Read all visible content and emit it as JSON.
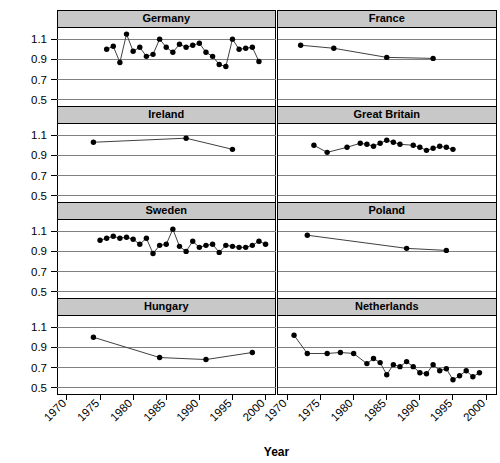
{
  "chart_data": {
    "type": "line",
    "title": "",
    "xlabel": "Year",
    "ylabel": "",
    "xlim": [
      1968.5,
      2001.5
    ],
    "ylim": [
      0.44,
      1.22
    ],
    "xticks": [
      1970,
      1975,
      1980,
      1985,
      1990,
      1995,
      2000
    ],
    "yticks": [
      0.5,
      0.7,
      0.9,
      1.1
    ],
    "grid": true,
    "legend": "none",
    "layout": "2 columns x 4 rows of panels (lattice/trellis), shared axes",
    "marker": "filled circle",
    "panels": [
      {
        "name": "Germany",
        "row": 1,
        "col": 1,
        "x": [
          1976,
          1977,
          1978,
          1979,
          1980,
          1981,
          1982,
          1983,
          1984,
          1985,
          1986,
          1987,
          1988,
          1989,
          1990,
          1991,
          1992,
          1993,
          1994,
          1995,
          1996,
          1997,
          1998,
          1999
        ],
        "y": [
          1.0,
          1.03,
          0.87,
          1.15,
          0.98,
          1.02,
          0.93,
          0.95,
          1.1,
          1.02,
          0.97,
          1.05,
          1.02,
          1.04,
          1.06,
          0.97,
          0.93,
          0.85,
          0.83,
          1.1,
          1.0,
          1.01,
          1.02,
          0.88
        ],
        "n_points": 24
      },
      {
        "name": "France",
        "row": 1,
        "col": 2,
        "x": [
          1972,
          1977,
          1985,
          1992
        ],
        "y": [
          1.04,
          1.01,
          0.92,
          0.91
        ],
        "n_points": 4
      },
      {
        "name": "Ireland",
        "row": 2,
        "col": 1,
        "x": [
          1974,
          1988,
          1995
        ],
        "y": [
          1.03,
          1.07,
          0.96
        ],
        "n_points": 3
      },
      {
        "name": "Great Britain",
        "row": 2,
        "col": 2,
        "x": [
          1974,
          1976,
          1979,
          1981,
          1982,
          1983,
          1984,
          1985,
          1986,
          1987,
          1989,
          1990,
          1991,
          1992,
          1993,
          1994,
          1995
        ],
        "y": [
          1.0,
          0.93,
          0.98,
          1.02,
          1.01,
          0.99,
          1.02,
          1.05,
          1.03,
          1.01,
          1.0,
          0.98,
          0.95,
          0.97,
          0.99,
          0.98,
          0.96
        ],
        "n_points": 17
      },
      {
        "name": "Sweden",
        "row": 3,
        "col": 1,
        "x": [
          1975,
          1976,
          1977,
          1978,
          1979,
          1980,
          1981,
          1982,
          1983,
          1984,
          1985,
          1986,
          1987,
          1988,
          1989,
          1990,
          1991,
          1992,
          1993,
          1994,
          1995,
          1996,
          1997,
          1998,
          1999,
          2000
        ],
        "y": [
          1.01,
          1.03,
          1.05,
          1.03,
          1.04,
          1.02,
          0.97,
          1.03,
          0.88,
          0.96,
          0.97,
          1.12,
          0.95,
          0.9,
          1.0,
          0.94,
          0.96,
          0.97,
          0.89,
          0.96,
          0.95,
          0.94,
          0.94,
          0.96,
          1.0,
          0.97
        ],
        "n_points": 26
      },
      {
        "name": "Poland",
        "row": 3,
        "col": 2,
        "x": [
          1973,
          1988,
          1994
        ],
        "y": [
          1.06,
          0.93,
          0.91
        ],
        "n_points": 3
      },
      {
        "name": "Hungary",
        "row": 4,
        "col": 1,
        "x": [
          1974,
          1984,
          1991,
          1998
        ],
        "y": [
          1.0,
          0.8,
          0.78,
          0.85
        ],
        "n_points": 4
      },
      {
        "name": "Netherlands",
        "row": 4,
        "col": 2,
        "x": [
          1971,
          1973,
          1976,
          1978,
          1980,
          1982,
          1983,
          1984,
          1985,
          1986,
          1987,
          1988,
          1989,
          1990,
          1991,
          1992,
          1993,
          1994,
          1995,
          1996,
          1997,
          1998,
          1999
        ],
        "y": [
          1.02,
          0.84,
          0.84,
          0.85,
          0.84,
          0.74,
          0.79,
          0.75,
          0.63,
          0.73,
          0.71,
          0.76,
          0.71,
          0.65,
          0.64,
          0.73,
          0.67,
          0.69,
          0.58,
          0.62,
          0.67,
          0.61,
          0.65
        ],
        "n_points": 23
      }
    ]
  },
  "style": {
    "strip_bg": "#c8c8c8",
    "grid_color": "#808080",
    "point_color": "#000000",
    "line_color": "#404040"
  }
}
